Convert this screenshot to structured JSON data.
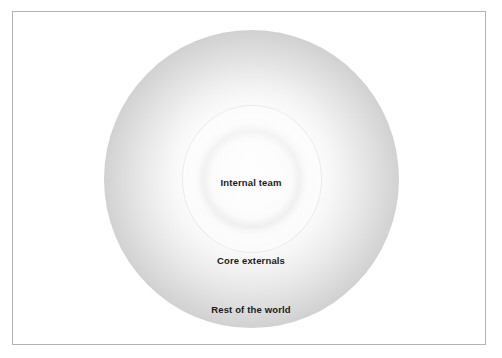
{
  "diagram": {
    "type": "concentric-sphere",
    "background_color": "#ffffff",
    "frame_color": "#b3b3b3",
    "sphere": {
      "center_color": "#fdfdfd",
      "rim_color": "#b5b5b5"
    },
    "zones": [
      {
        "id": "internal-team",
        "label": "Internal team",
        "order": 1
      },
      {
        "id": "core-externals",
        "label": "Core externals",
        "order": 2
      },
      {
        "id": "rest-of-the-world",
        "label": "Rest of the world",
        "order": 3
      }
    ]
  }
}
